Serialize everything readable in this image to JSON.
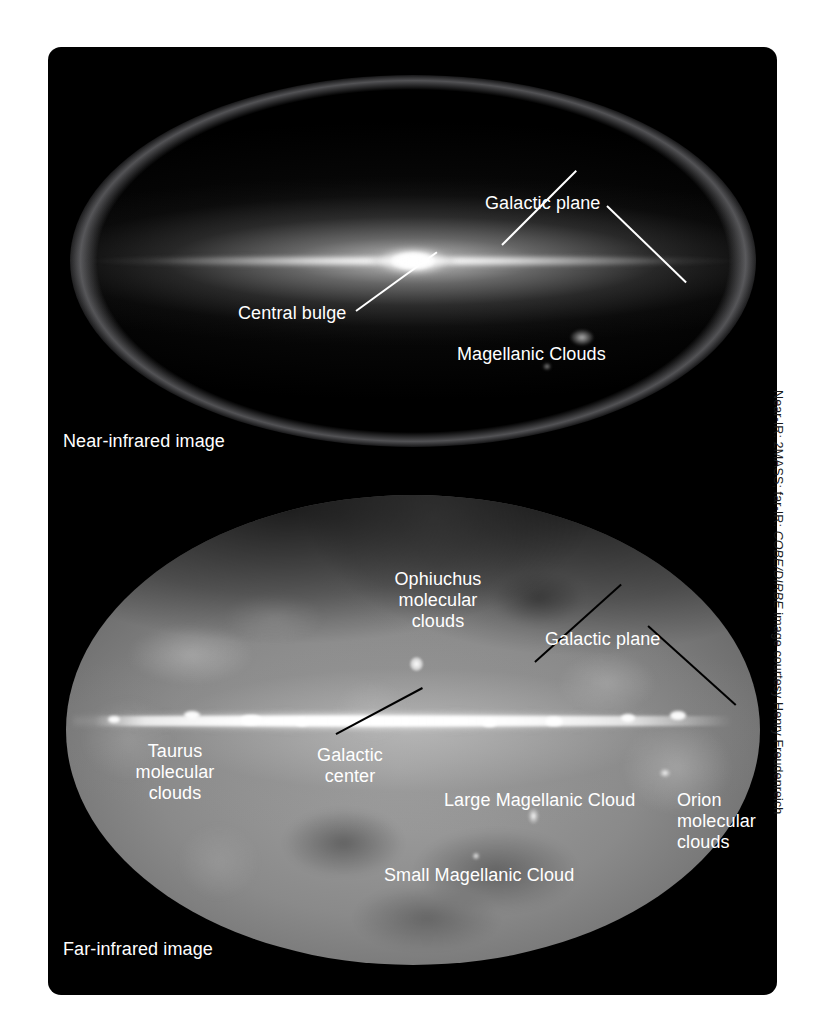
{
  "figure": {
    "background_color": "#ffffff",
    "panel_color": "#000000"
  },
  "near_infrared": {
    "caption": "Near-infrared image",
    "labels": {
      "galactic_plane": "Galactic plane",
      "central_bulge": "Central bulge",
      "magellanic_clouds": "Magellanic Clouds"
    },
    "leader_color": "#ffffff"
  },
  "far_infrared": {
    "caption": "Far-infrared image",
    "labels": {
      "ophiuchus": "Ophiuchus\nmolecular\nclouds",
      "galactic_plane": "Galactic plane",
      "galactic_center": "Galactic\ncenter",
      "taurus": "Taurus\nmolecular\nclouds",
      "large_magellanic_cloud": "Large Magellanic Cloud",
      "orion": "Orion\nmolecular\nclouds",
      "small_magellanic_cloud": "Small Magellanic Cloud"
    },
    "leader_color": "#000000"
  },
  "credit": {
    "prefix": "Near-IR: 2MASS; far-IR: ",
    "italic": "COBE/DIRBE",
    "suffix": " image courtesy Henry Freudenreich"
  }
}
